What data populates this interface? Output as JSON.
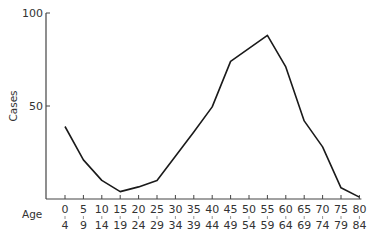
{
  "chart_data": {
    "type": "line",
    "title": "",
    "xlabel": "Age",
    "ylabel": "Cases",
    "ylim": [
      0,
      100
    ],
    "yticks": [
      50,
      100
    ],
    "grid": false,
    "legend": null,
    "categories": [
      "0-4",
      "5-9",
      "10-14",
      "15-19",
      "20-24",
      "25-29",
      "30-34",
      "35-39",
      "40-44",
      "45-49",
      "50-54",
      "55-59",
      "60-64",
      "65-69",
      "70-74",
      "75-79",
      "80-84"
    ],
    "x_tick_top": [
      "0",
      "5",
      "10",
      "15",
      "20",
      "25",
      "30",
      "35",
      "40",
      "45",
      "50",
      "55",
      "60",
      "65",
      "70",
      "75",
      "80"
    ],
    "x_tick_bottom": [
      "4",
      "9",
      "14",
      "19",
      "24",
      "29",
      "34",
      "39",
      "44",
      "49",
      "54",
      "59",
      "64",
      "69",
      "74",
      "79",
      "84"
    ],
    "series": [
      {
        "name": "Cases",
        "values": [
          39,
          21,
          10,
          4,
          6.5,
          10,
          23,
          36,
          49.5,
          74,
          81,
          88,
          71,
          42,
          28,
          6,
          1
        ]
      }
    ]
  }
}
